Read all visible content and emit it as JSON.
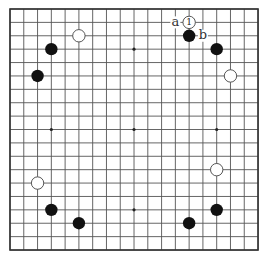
{
  "board": {
    "size": 19,
    "origin_x": 10,
    "origin_y": 9,
    "spacing_x": 13.78,
    "spacing_y": 13.39,
    "stone_radius": 6.2,
    "colors": {
      "line": "#555555",
      "border": "#333333",
      "black": "#111111",
      "white": "#ffffff"
    },
    "star_points": [
      [
        3,
        3
      ],
      [
        9,
        3
      ],
      [
        15,
        3
      ],
      [
        3,
        9
      ],
      [
        9,
        9
      ],
      [
        15,
        9
      ],
      [
        3,
        15
      ],
      [
        9,
        15
      ],
      [
        15,
        15
      ]
    ],
    "stones": [
      {
        "color": "white",
        "col": 13,
        "row": 1,
        "label": "1"
      },
      {
        "color": "black",
        "col": 13,
        "row": 2,
        "label": ""
      },
      {
        "color": "black",
        "col": 15,
        "row": 3,
        "label": ""
      },
      {
        "color": "white",
        "col": 16,
        "row": 5,
        "label": ""
      },
      {
        "color": "white",
        "col": 5,
        "row": 2,
        "label": ""
      },
      {
        "color": "black",
        "col": 3,
        "row": 3,
        "label": ""
      },
      {
        "color": "black",
        "col": 2,
        "row": 5,
        "label": ""
      },
      {
        "color": "white",
        "col": 2,
        "row": 13,
        "label": ""
      },
      {
        "color": "black",
        "col": 3,
        "row": 15,
        "label": ""
      },
      {
        "color": "black",
        "col": 5,
        "row": 16,
        "label": ""
      },
      {
        "color": "white",
        "col": 15,
        "row": 12,
        "label": ""
      },
      {
        "color": "black",
        "col": 15,
        "row": 15,
        "label": ""
      },
      {
        "color": "black",
        "col": 13,
        "row": 16,
        "label": ""
      }
    ],
    "point_labels": [
      {
        "text": "a",
        "col": 12,
        "row": 1
      },
      {
        "text": "b",
        "col": 14,
        "row": 2
      }
    ]
  }
}
